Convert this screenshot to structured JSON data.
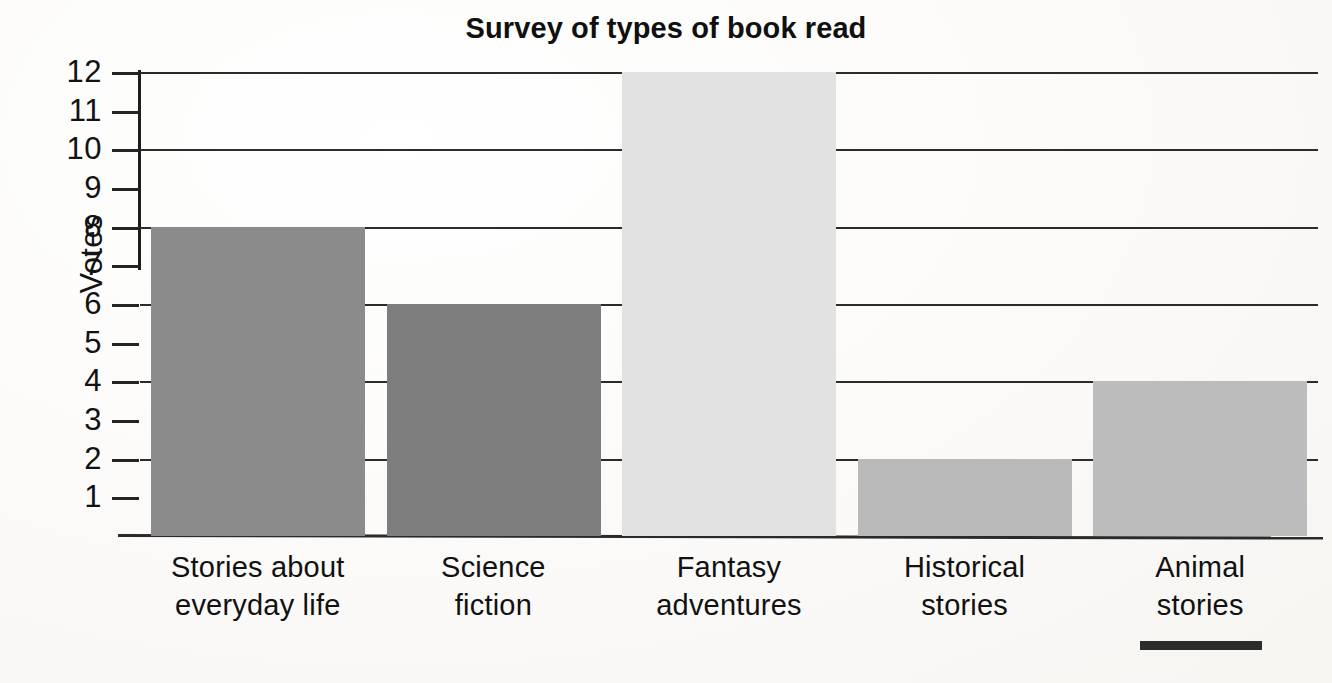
{
  "chart_data": {
    "type": "bar",
    "title": "Survey of types of book read",
    "xlabel": "",
    "ylabel": "Votes",
    "categories": [
      "Stories about everyday life",
      "Science fiction",
      "Fantasy adventures",
      "Historical stories",
      "Animal stories"
    ],
    "category_lines": [
      [
        "Stories about",
        "everyday life"
      ],
      [
        "Science",
        "fiction"
      ],
      [
        "Fantasy",
        "adventures"
      ],
      [
        "Historical",
        "stories"
      ],
      [
        "Animal",
        "stories"
      ]
    ],
    "values": [
      8,
      6,
      12,
      2,
      4
    ],
    "ylim": [
      0,
      12
    ],
    "ytick_labels": [
      "12",
      "11",
      "10",
      "9",
      "8",
      "7",
      "6",
      "5",
      "4",
      "3",
      "2",
      "1"
    ],
    "ytick_values": [
      12,
      11,
      10,
      9,
      8,
      7,
      6,
      5,
      4,
      3,
      2,
      1
    ],
    "gridline_values": [
      12,
      10,
      8,
      6,
      4,
      2
    ],
    "grid": true,
    "legend": "none",
    "bar_colors": [
      "#8b8b8b",
      "#7d7d7d",
      "#e2e2e2",
      "#b9b9b9",
      "#bcbcbc"
    ],
    "axis_color": "#2a2a2a",
    "text_color": "#111111",
    "background_color": "#fbfbfa"
  }
}
